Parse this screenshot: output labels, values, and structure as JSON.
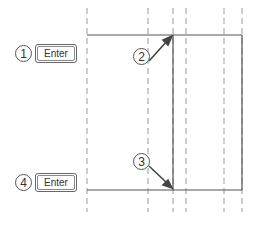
{
  "callouts": [
    {
      "number": "1",
      "key": "Enter"
    },
    {
      "number": "4",
      "key": "Enter"
    }
  ],
  "markers": [
    {
      "number": "2"
    },
    {
      "number": "3"
    }
  ],
  "colors": {
    "line": "#555555",
    "dashed": "#999999"
  }
}
